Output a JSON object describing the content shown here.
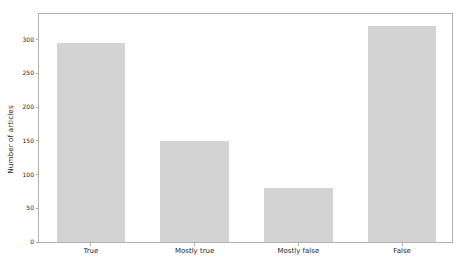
{
  "chart_data": {
    "type": "bar",
    "title": "",
    "xlabel": "",
    "ylabel": "Number of articles",
    "categories": [
      "True",
      "Mostly true",
      "Mostly false",
      "False"
    ],
    "values": [
      295,
      150,
      80,
      320
    ],
    "ylim": [
      0,
      338
    ],
    "yticks": [
      0,
      50,
      100,
      150,
      200,
      250,
      300
    ],
    "ytick_labels": [
      "0",
      "50",
      "100",
      "150",
      "200",
      "250",
      "300"
    ],
    "grid": false,
    "legend": null,
    "bar_color": "#d3d3d3",
    "axis_color": "#b0b0b0",
    "text_color": "#262626",
    "background_color": "#ffffff"
  }
}
